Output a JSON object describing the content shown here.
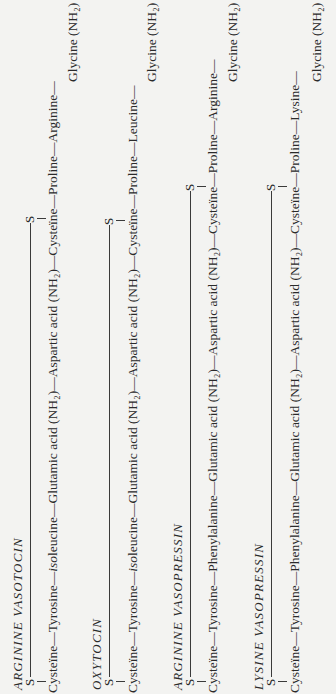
{
  "hormones": [
    {
      "title": "ARGININE VASOTOCIN",
      "bridge_atoms": [
        "S",
        "S"
      ],
      "chain": [
        "Cysteïne",
        "Tyrosine",
        "isoleucine",
        "Glutamic acid (NH₂)",
        "Aspartic acid (NH₂)",
        "Cysteïne",
        "Proline",
        "Arginine"
      ],
      "chain_text": "Cysteïne—Tyrosine—",
      "chain_italic": "iso",
      "chain_rest": "leucine—Glutamic acid (NH₂)—Aspartic acid (NH₂)—Cysteïne—Proline—Arginine—",
      "terminal": "Glycine (NH₂)"
    },
    {
      "title": "OXYTOCIN",
      "bridge_atoms": [
        "S",
        "S"
      ],
      "chain": [
        "Cysteïne",
        "Tyrosine",
        "isoleucine",
        "Glutamic acid (NH₂)",
        "Aspartic acid (NH₂)",
        "Cysteïne",
        "Proline",
        "Leucine"
      ],
      "chain_text": "Cysteïne—Tyrosine—",
      "chain_italic": "iso",
      "chain_rest": "leucine—Glutamic acid (NH₂)—Aspartic acid (NH₂)—Cysteïne—Proline—Leucine—",
      "terminal": "Glycine (NH₂)"
    },
    {
      "title": "ARGININE VASOPRESSIN",
      "bridge_atoms": [
        "S",
        "S"
      ],
      "chain": [
        "Cysteïne",
        "Tyrosine",
        "Phenylalanine",
        "Glutamic acid (NH₂)",
        "Aspartic acid (NH₂)",
        "Cysteïne",
        "Proline",
        "Arginine"
      ],
      "chain_text": "Cysteïne—Tyrosine—Phenylalanine—Glutamic acid (NH₂)—Aspartic acid (NH₂)—Cysteïne—Proline—Arginine—",
      "chain_italic": "",
      "chain_rest": "",
      "terminal": "Glycine (NH₂)"
    },
    {
      "title": "LYSINE VASOPRESSIN",
      "bridge_atoms": [
        "S",
        "S"
      ],
      "chain": [
        "Cysteïne",
        "Tyrosine",
        "Phenylalanine",
        "Glutamic acid (NH₂)",
        "Aspartic acid (NH₂)",
        "Cysteïne",
        "Proline",
        "Lysine"
      ],
      "chain_text": "Cysteïne—Tyrosine—Phenylalanine—Glutamic acid (NH₂)—Aspartic acid (NH₂)—Cysteïne—Proline—Lysine—",
      "chain_italic": "",
      "chain_rest": "",
      "terminal": "Glycine (NH₂)"
    }
  ]
}
